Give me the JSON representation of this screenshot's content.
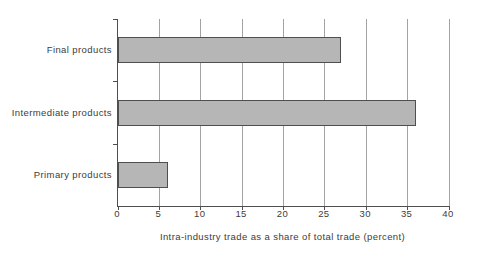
{
  "chart_data": {
    "type": "bar",
    "orientation": "horizontal",
    "categories": [
      "Final products",
      "Intermediate products",
      "Primary products"
    ],
    "values": [
      27,
      36,
      6
    ],
    "title": "",
    "xlabel": "Intra-industry trade as a share of total trade (percent)",
    "ylabel": "",
    "xlim": [
      0,
      40
    ],
    "xticks": [
      0,
      5,
      10,
      15,
      20,
      25,
      30,
      35,
      40
    ],
    "grid": "vertical",
    "legend": "none",
    "colors": {
      "bar_fill": "#b6b6b6",
      "bar_border": "#4f4f4f",
      "gridline": "#a3a3a3",
      "axis": "#4f4f4f",
      "text": "#3c3c3c",
      "background": "#ffffff"
    }
  }
}
